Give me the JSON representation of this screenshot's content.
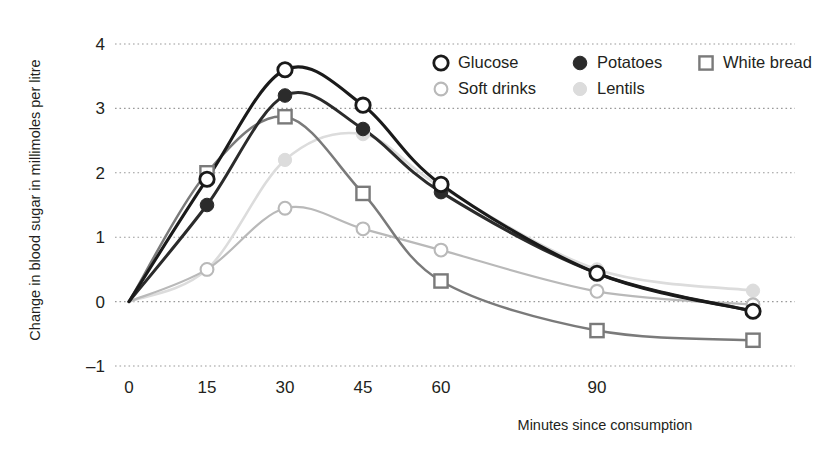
{
  "chart_data": {
    "type": "line",
    "title": "",
    "xlabel": "Minutes since consumption",
    "ylabel": "Change in blood sugar in millimoles per litre",
    "x_tick_labels": [
      "0",
      "15",
      "30",
      "45",
      "60",
      "90"
    ],
    "x_tick_values": [
      0,
      15,
      30,
      45,
      60,
      90
    ],
    "y_tick_labels": [
      "-1",
      "0",
      "1",
      "2",
      "3",
      "4"
    ],
    "y_tick_values": [
      -1,
      0,
      1,
      2,
      3,
      4
    ],
    "xlim": [
      0,
      120
    ],
    "ylim": [
      -1,
      4
    ],
    "grid": "horizontal-dotted",
    "legend_position": "top-right",
    "series": [
      {
        "name": "Glucose",
        "marker": "open-circle",
        "color": "#1a1a1a",
        "x": [
          0,
          15,
          30,
          45,
          60,
          90,
          120
        ],
        "values": [
          0.0,
          1.9,
          3.6,
          3.05,
          1.82,
          0.44,
          -0.15
        ]
      },
      {
        "name": "Potatoes",
        "marker": "filled-circle",
        "color": "#2b2b2b",
        "x": [
          0,
          15,
          30,
          45,
          60,
          90,
          120
        ],
        "values": [
          0.0,
          1.5,
          3.2,
          2.68,
          1.7,
          0.44,
          -0.15
        ]
      },
      {
        "name": "White bread",
        "marker": "open-square",
        "color": "#7a7a7a",
        "x": [
          0,
          15,
          30,
          45,
          60,
          90,
          120
        ],
        "values": [
          0.0,
          2.0,
          2.87,
          1.68,
          0.32,
          -0.45,
          -0.6
        ]
      },
      {
        "name": "Soft drinks",
        "marker": "open-circle-light",
        "color": "#b9b9b9",
        "x": [
          0,
          15,
          30,
          45,
          60,
          90,
          120
        ],
        "values": [
          0.0,
          0.5,
          1.45,
          1.13,
          0.8,
          0.16,
          -0.05
        ]
      },
      {
        "name": "Lentils",
        "marker": "filled-circle-light",
        "color": "#dcdcdc",
        "x": [
          0,
          15,
          30,
          45,
          60,
          90,
          120
        ],
        "values": [
          0.0,
          0.5,
          2.2,
          2.6,
          1.78,
          0.5,
          0.17
        ]
      }
    ]
  },
  "legend": {
    "entries": [
      {
        "label": "Glucose",
        "marker": "open-circle",
        "color": "#1a1a1a"
      },
      {
        "label": "Potatoes",
        "marker": "filled-circle",
        "color": "#2b2b2b"
      },
      {
        "label": "White bread",
        "marker": "open-square",
        "color": "#7a7a7a"
      },
      {
        "label": "Soft drinks",
        "marker": "open-circle-light",
        "color": "#b9b9b9"
      },
      {
        "label": "Lentils",
        "marker": "filled-circle-light",
        "color": "#dcdcdc"
      }
    ]
  },
  "axes": {
    "x_title": "Minutes since consumption",
    "y_title": "Change in blood sugar in millimoles per litre"
  }
}
